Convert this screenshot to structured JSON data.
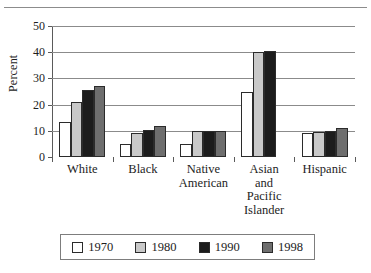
{
  "chart_data": {
    "type": "bar",
    "title": "",
    "xlabel": "",
    "ylabel": "Percent",
    "ylim": [
      0,
      50
    ],
    "yticks": [
      0,
      10,
      20,
      30,
      40,
      50
    ],
    "grid": true,
    "legend_position": "bottom",
    "categories": [
      "White",
      "Black",
      "Native American",
      "Asian and Pacific Islander",
      "Hispanic"
    ],
    "category_lines": [
      [
        "White"
      ],
      [
        "Black"
      ],
      [
        "Native",
        "American"
      ],
      [
        "Asian",
        "and",
        "Pacific",
        "Islander"
      ],
      [
        "Hispanic"
      ]
    ],
    "series": [
      {
        "name": "1970",
        "color": "#ffffff",
        "values": [
          13.5,
          5,
          5,
          25,
          9
        ]
      },
      {
        "name": "1980",
        "color": "#c9c9c9",
        "values": [
          21,
          9,
          10,
          40,
          9.5
        ]
      },
      {
        "name": "1990",
        "color": "#1c1c1c",
        "values": [
          25.5,
          10.5,
          10,
          40.5,
          10
        ]
      },
      {
        "name": "1998",
        "color": "#6e6e6e",
        "values": [
          27,
          12,
          10,
          null,
          11
        ]
      }
    ]
  }
}
